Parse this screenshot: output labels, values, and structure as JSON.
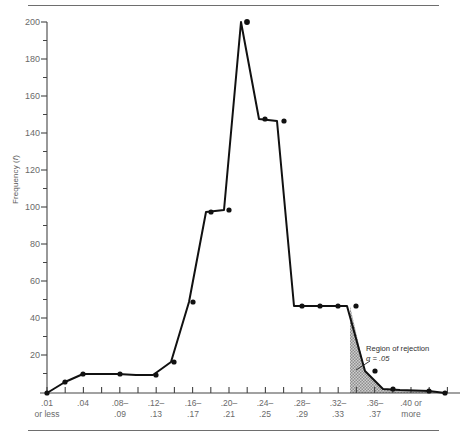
{
  "chart_data": {
    "type": "line",
    "title": "",
    "subtitle": "",
    "xlabel": "",
    "ylabel": "Frequency (f)",
    "ylim": [
      0,
      200
    ],
    "xlim": [
      0,
      20
    ],
    "grid": false,
    "legend": "none",
    "y_major_step": 20,
    "y_minor_step": 10,
    "y_ticks": [
      0,
      20,
      40,
      60,
      80,
      100,
      120,
      140,
      160,
      180,
      200
    ],
    "y_tick_labels": [
      "",
      "20",
      "40",
      "60",
      "80",
      "100",
      "120",
      "140",
      "160",
      "180",
      "200"
    ],
    "x_tick_count": 21,
    "x_tick_labels": [
      {
        "index": 0,
        "line1": ".01",
        "line2": "or less"
      },
      {
        "index": 2,
        "line1": ".04",
        "line2": ""
      },
      {
        "index": 4,
        "line1": ".08–",
        "line2": ".09"
      },
      {
        "index": 6,
        "line1": ".12–",
        "line2": ".13"
      },
      {
        "index": 8,
        "line1": ".16–",
        "line2": ".17"
      },
      {
        "index": 10,
        "line1": ".20–",
        "line2": ".21"
      },
      {
        "index": 12,
        "line1": ".24–",
        "line2": ".25"
      },
      {
        "index": 14,
        "line1": ".28–",
        "line2": ".29"
      },
      {
        "index": 16,
        "line1": ".32–",
        "line2": ".33"
      },
      {
        "index": 18,
        "line1": ".36–",
        "line2": ".37"
      },
      {
        "index": 20,
        "line1": ".40 or",
        "line2": "more"
      }
    ],
    "categories": [
      ".01 or less",
      ".02-.03",
      ".04",
      ".06-.07",
      ".08-.09",
      ".10-.11",
      ".12-.13",
      ".14-.15",
      ".16-.17",
      ".18-.19",
      ".20-.21",
      ".22-.23",
      ".24-.25",
      ".26-.27",
      ".28-.29",
      ".30-.31",
      ".32-.33",
      ".34-.35",
      ".36-.37",
      ".38-.39",
      ".40 or more"
    ],
    "series": [
      {
        "name": "Frequency",
        "values": [
          0,
          6,
          10,
          11,
          11,
          10,
          10,
          17,
          50,
          98,
          100,
          200,
          150,
          149,
          50,
          49,
          49,
          49,
          15,
          5,
          2
        ],
        "color": "#111111"
      }
    ],
    "points_px": [
      [
        47,
        393
      ],
      [
        65,
        382
      ],
      [
        83,
        374
      ],
      [
        100,
        374
      ],
      [
        118,
        374
      ],
      [
        136,
        375
      ],
      [
        153,
        375
      ],
      [
        171,
        362
      ],
      [
        189,
        302
      ],
      [
        206,
        212
      ],
      [
        224,
        210
      ],
      [
        241,
        22
      ],
      [
        259,
        119
      ],
      [
        277,
        121
      ],
      [
        294,
        306
      ],
      [
        312,
        306
      ],
      [
        330,
        306
      ],
      [
        347,
        306
      ],
      [
        365,
        371
      ],
      [
        383,
        389
      ],
      [
        400,
        390
      ]
    ],
    "polygon_points_px": "47,393 65,382 83,374 100,374 118,374 136,375 153,375 171,362 189,302 206,212 224,210 241,22 259,119 277,121 294,306 312,306 330,306 347,306 365,371 383,389 400,390",
    "shaded_region": {
      "label_line1": "Region of rejection",
      "label_line2_prefix": "α",
      "label_line2": "α = .05",
      "fill": "#a8a8a8",
      "start_x_px": 350,
      "end_x_px": 445
    },
    "axis_px": {
      "x0": 47,
      "x1": 460,
      "y0": 393,
      "y_top": 22,
      "tick_spacing": 19.15
    }
  }
}
